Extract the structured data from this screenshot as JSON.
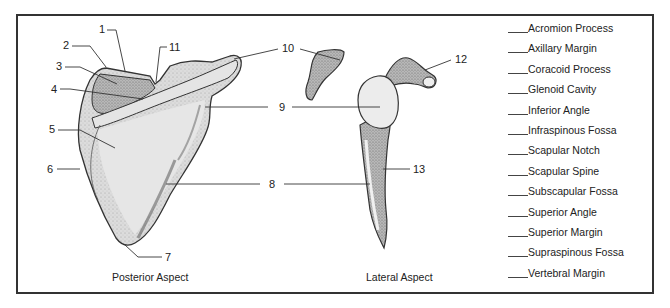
{
  "diagram": {
    "views": [
      {
        "id": "posterior",
        "caption": "Posterior Aspect"
      },
      {
        "id": "lateral",
        "caption": "Lateral Aspect"
      }
    ],
    "callouts": [
      {
        "number": "1",
        "view": "posterior"
      },
      {
        "number": "2",
        "view": "posterior"
      },
      {
        "number": "3",
        "view": "posterior"
      },
      {
        "number": "4",
        "view": "posterior"
      },
      {
        "number": "5",
        "view": "posterior"
      },
      {
        "number": "6",
        "view": "posterior"
      },
      {
        "number": "7",
        "view": "posterior"
      },
      {
        "number": "8",
        "view": "both"
      },
      {
        "number": "9",
        "view": "both"
      },
      {
        "number": "10",
        "view": "both"
      },
      {
        "number": "11",
        "view": "posterior"
      },
      {
        "number": "12",
        "view": "lateral"
      },
      {
        "number": "13",
        "view": "lateral"
      }
    ],
    "word_bank": [
      {
        "blank": "____",
        "term": "Acromion Process"
      },
      {
        "blank": "____",
        "term": "Axillary Margin"
      },
      {
        "blank": "____",
        "term": "Coracoid Process"
      },
      {
        "blank": "____",
        "term": "Glenoid Cavity"
      },
      {
        "blank": "____",
        "term": "Inferior Angle"
      },
      {
        "blank": "____",
        "term": "Infraspinous Fossa"
      },
      {
        "blank": "____",
        "term": "Scapular Notch"
      },
      {
        "blank": "____",
        "term": "Scapular Spine"
      },
      {
        "blank": "____",
        "term": "Subscapular Fossa"
      },
      {
        "blank": "____",
        "term": "Superior Angle"
      },
      {
        "blank": "____",
        "term": "Superior Margin"
      },
      {
        "blank": "____",
        "term": "Supraspinous Fossa"
      },
      {
        "blank": "____",
        "term": "Vertebral Margin"
      }
    ],
    "colors": {
      "bone_fill": "#d9d9d9",
      "bone_dark": "#8a8a8a",
      "outline": "#333333",
      "frame": "#333333"
    }
  }
}
